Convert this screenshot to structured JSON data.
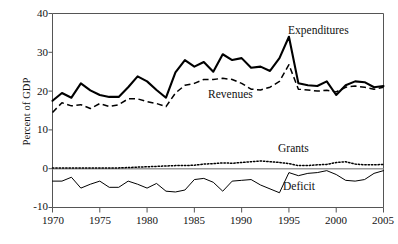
{
  "chart_data": {
    "type": "line",
    "title": "",
    "xlabel": "",
    "ylabel": "Percent of GDP",
    "xlim": [
      1970,
      2005
    ],
    "ylim": [
      -10,
      40
    ],
    "yticks": [
      40,
      30,
      20,
      10,
      0,
      -10
    ],
    "xticks": [
      1970,
      1975,
      1980,
      1985,
      1990,
      1995,
      2000,
      2005
    ],
    "grid": false,
    "legend_position": "inline-annotations",
    "x": [
      1970,
      1971,
      1972,
      1973,
      1974,
      1975,
      1976,
      1977,
      1978,
      1979,
      1980,
      1981,
      1982,
      1983,
      1984,
      1985,
      1986,
      1987,
      1988,
      1989,
      1990,
      1991,
      1992,
      1993,
      1994,
      1995,
      1996,
      1997,
      1998,
      1999,
      2000,
      2001,
      2002,
      2003,
      2004,
      2005
    ],
    "series": [
      {
        "name": "Expenditures",
        "style": "solid-thick",
        "color": "#000000",
        "values": [
          17.5,
          19.5,
          18.3,
          22.0,
          20.2,
          19.0,
          18.5,
          18.5,
          21.0,
          23.8,
          22.5,
          20.3,
          18.3,
          24.8,
          28.0,
          26.3,
          27.5,
          25.0,
          29.5,
          28.0,
          28.5,
          26.0,
          26.3,
          25.2,
          28.5,
          34.0,
          22.0,
          21.5,
          21.3,
          22.5,
          19.0,
          21.5,
          22.5,
          22.3,
          21.0,
          21.3
        ]
      },
      {
        "name": "Revenues",
        "style": "dashed",
        "color": "#000000",
        "values": [
          14.5,
          17.0,
          16.2,
          16.5,
          15.5,
          16.8,
          16.0,
          16.5,
          18.0,
          18.0,
          17.3,
          16.8,
          16.0,
          19.5,
          21.5,
          22.0,
          23.0,
          23.0,
          23.3,
          23.0,
          22.0,
          20.5,
          20.3,
          21.0,
          22.5,
          26.8,
          20.5,
          20.3,
          20.0,
          20.2,
          19.8,
          21.0,
          21.3,
          21.0,
          20.5,
          21.0
        ]
      },
      {
        "name": "Grants",
        "style": "dotted",
        "color": "#000000",
        "values": [
          0.2,
          0.2,
          0.2,
          0.2,
          0.2,
          0.2,
          0.2,
          0.2,
          0.3,
          0.4,
          0.5,
          0.6,
          0.7,
          0.8,
          0.8,
          0.9,
          1.2,
          1.3,
          1.5,
          1.4,
          1.6,
          1.8,
          2.0,
          1.8,
          1.6,
          1.3,
          0.8,
          0.8,
          1.0,
          1.1,
          1.6,
          1.8,
          1.2,
          1.0,
          1.0,
          1.1
        ]
      },
      {
        "name": "Deficit",
        "style": "solid-thin",
        "color": "#000000",
        "values": [
          -3.2,
          -3.2,
          -2.2,
          -5.0,
          -4.0,
          -3.2,
          -4.8,
          -4.8,
          -3.2,
          -4.0,
          -5.0,
          -3.8,
          -5.8,
          -6.0,
          -5.5,
          -2.8,
          -2.5,
          -3.5,
          -5.8,
          -3.2,
          -3.0,
          -2.8,
          -4.2,
          -5.2,
          -6.2,
          -1.0,
          -1.8,
          -1.2,
          -1.0,
          -0.5,
          -1.5,
          -3.0,
          -3.2,
          -2.8,
          -1.2,
          -0.5
        ]
      }
    ],
    "annotations": [
      {
        "text": "Expenditures",
        "x": 1995,
        "y": 35
      },
      {
        "text": "Revenues",
        "x": 1986,
        "y": 16
      },
      {
        "text": "Grants",
        "x": 1994,
        "y": 6
      },
      {
        "text": "Deficit",
        "x": 1995,
        "y": -4
      }
    ]
  },
  "axis": {
    "y_title": "Percent of GDP",
    "y_tick_labels": [
      "40",
      "30",
      "20",
      "10",
      "0",
      "-10"
    ],
    "x_tick_labels": [
      "1970",
      "1975",
      "1980",
      "1985",
      "1990",
      "1995",
      "2000",
      "2005"
    ]
  },
  "labels": {
    "expenditures": "Expenditures",
    "revenues": "Revenues",
    "grants": "Grants",
    "deficit": "Deficit"
  }
}
